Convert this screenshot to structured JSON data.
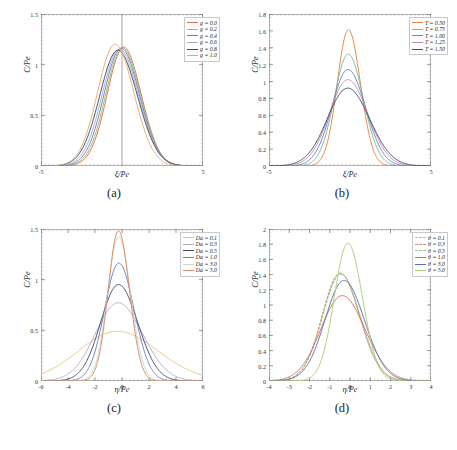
{
  "figure": {
    "panels": [
      {
        "id": "a",
        "caption": "(a)",
        "xlabel": "ξ/Pe",
        "ylabel": "C/Pe",
        "xlim": [
          -5,
          5
        ],
        "ylim": [
          0,
          1.5
        ],
        "xticks": [
          "-5",
          "5"
        ],
        "yticks": [
          "0",
          "0.5",
          "1",
          "1.5"
        ],
        "ytickvals": [
          0,
          0.5,
          1,
          1.5
        ],
        "xtickvals": [
          -5,
          5
        ],
        "vline": 0,
        "legend_pos": "top-right",
        "chart_data": {
          "type": "line",
          "title": "",
          "xlabel": "ξ/Pe",
          "ylabel": "C/Pe",
          "xlim": [
            -5,
            5
          ],
          "ylim": [
            0,
            1.5
          ],
          "grid": false,
          "legend": "top-right",
          "series": [
            {
              "name": "g = 0.0",
              "color": "#e06a4e",
              "dash": false,
              "peak": 1.17,
              "center": 0.18,
              "width": 1.05
            },
            {
              "name": "g = 0.2",
              "color": "#8fbf6a",
              "dash": false,
              "peak": 1.165,
              "center": 0.11,
              "width": 1.07
            },
            {
              "name": "g = 0.4",
              "color": "#6b7fc0",
              "dash": false,
              "peak": 1.16,
              "center": 0.03,
              "width": 1.1
            },
            {
              "name": "g = 0.6",
              "color": "#a9a9c4",
              "dash": false,
              "peak": 1.15,
              "center": -0.06,
              "width": 1.13
            },
            {
              "name": "g = 0.8",
              "color": "#3d4a6b",
              "dash": false,
              "peak": 1.14,
              "center": -0.16,
              "width": 1.17
            },
            {
              "name": "g = 1.0",
              "color": "#e8a86a",
              "dash": false,
              "peak": 1.2,
              "center": -0.34,
              "width": 1.12
            }
          ]
        }
      },
      {
        "id": "b",
        "caption": "(b)",
        "xlabel": "ξ/Pe",
        "ylabel": "C/Pe",
        "xlim": [
          -5,
          5
        ],
        "ylim": [
          0,
          1.8
        ],
        "xticks": [
          "-5",
          "5"
        ],
        "yticks": [
          "0",
          "0.2",
          "0.4",
          "0.6",
          "0.8",
          "1",
          "1.2",
          "1.4",
          "1.6",
          "1.8"
        ],
        "ytickvals": [
          0,
          0.2,
          0.4,
          0.6,
          0.8,
          1.0,
          1.2,
          1.4,
          1.6,
          1.8
        ],
        "xtickvals": [
          -5,
          5
        ],
        "vline": null,
        "legend_pos": "top-right",
        "chart_data": {
          "type": "line",
          "title": "",
          "xlabel": "ξ/Pe",
          "ylabel": "C/Pe",
          "xlim": [
            -5,
            5
          ],
          "ylim": [
            0,
            1.8
          ],
          "grid": false,
          "legend": "top-right",
          "series": [
            {
              "name": "T = 0.50",
              "color": "#e8833f",
              "dash": false,
              "peak": 1.61,
              "center": -0.04,
              "width": 0.72
            },
            {
              "name": "T = 0.75",
              "color": "#7ab8a0",
              "dash": false,
              "peak": 1.32,
              "center": -0.04,
              "width": 0.9
            },
            {
              "name": "T = 1.00",
              "color": "#6b82c4",
              "dash": false,
              "peak": 1.14,
              "center": -0.04,
              "width": 1.05
            },
            {
              "name": "T = 1.25",
              "color": "#c58aa8",
              "dash": false,
              "peak": 1.02,
              "center": -0.04,
              "width": 1.19
            },
            {
              "name": "T = 1.50",
              "color": "#3d4a6b",
              "dash": false,
              "peak": 0.92,
              "center": -0.04,
              "width": 1.31
            }
          ]
        }
      },
      {
        "id": "c",
        "caption": "(c)",
        "xlabel": "η/Pe",
        "ylabel": "C/Pe",
        "xlim": [
          -6,
          6
        ],
        "ylim": [
          0,
          1.5
        ],
        "xticks": [
          "-6",
          "-4",
          "-2",
          "0",
          "2",
          "4",
          "6"
        ],
        "yticks": [
          "0",
          "0.5",
          "1",
          "1.5"
        ],
        "ytickvals": [
          0,
          0.5,
          1,
          1.5
        ],
        "xtickvals": [
          -6,
          -4,
          -2,
          0,
          2,
          4,
          6
        ],
        "vline": null,
        "legend_pos": "top-right",
        "chart_data": {
          "type": "line",
          "title": "",
          "xlabel": "η/Pe",
          "ylabel": "C/Pe",
          "xlim": [
            -6,
            6
          ],
          "ylim": [
            0,
            1.5
          ],
          "grid": false,
          "legend": "top-right",
          "series": [
            {
              "name": "Da = 0.1",
              "color": "#e8c07a",
              "dash": false,
              "peak": 0.49,
              "center": -0.15,
              "width": 2.95
            },
            {
              "name": "Da = 0.3",
              "color": "#b8a8c8",
              "dash": false,
              "peak": 0.77,
              "center": -0.15,
              "width": 1.75
            },
            {
              "name": "Da = 0.5",
              "color": "#3d4a6b",
              "dash": false,
              "peak": 0.95,
              "center": -0.15,
              "width": 1.38
            },
            {
              "name": "Da = 1.0",
              "color": "#6b82c4",
              "dash": false,
              "peak": 1.16,
              "center": -0.15,
              "width": 1.1
            },
            {
              "name": "Da = 3.0",
              "color": "#cfd9c0",
              "dash": false,
              "peak": 1.42,
              "center": -0.18,
              "width": 0.86
            },
            {
              "name": "Da = 5.0",
              "color": "#d98a6a",
              "dash": false,
              "peak": 1.48,
              "center": -0.2,
              "width": 0.79
            }
          ]
        }
      },
      {
        "id": "d",
        "caption": "(d)",
        "xlabel": "η/Pe",
        "ylabel": "C/Pe",
        "xlim": [
          -4,
          4
        ],
        "ylim": [
          0,
          2
        ],
        "xticks": [
          "-4",
          "-3",
          "-2",
          "-1",
          "0",
          "1",
          "2",
          "3",
          "4"
        ],
        "yticks": [
          "0",
          "0.2",
          "0.4",
          "0.6",
          "0.8",
          "1",
          "1.2",
          "1.4",
          "1.6",
          "1.8",
          "2"
        ],
        "ytickvals": [
          0,
          0.2,
          0.4,
          0.6,
          0.8,
          1.0,
          1.2,
          1.4,
          1.6,
          1.8,
          2.0
        ],
        "xtickvals": [
          -4,
          -3,
          -2,
          -1,
          0,
          1,
          2,
          3,
          4
        ],
        "vline": null,
        "legend_pos": "top-right",
        "chart_data": {
          "type": "line",
          "title": "",
          "xlabel": "η/Pe",
          "ylabel": "C/Pe",
          "xlim": [
            -4,
            4
          ],
          "ylim": [
            0,
            2
          ],
          "grid": false,
          "legend": "top-right",
          "series": [
            {
              "name": "θ = 0.1",
              "color": "#b8b8b8",
              "dash": true,
              "peak": 1.42,
              "center": -0.42,
              "width": 0.92
            },
            {
              "name": "θ = 0.3",
              "color": "#d98a6a",
              "dash": true,
              "peak": 1.41,
              "center": -0.4,
              "width": 0.93
            },
            {
              "name": "θ = 0.5",
              "color": "#9cc47a",
              "dash": true,
              "peak": 1.4,
              "center": -0.38,
              "width": 0.94
            },
            {
              "name": "θ = 1.0",
              "color": "#d96a5a",
              "dash": false,
              "peak": 1.12,
              "center": -0.3,
              "width": 1.1
            },
            {
              "name": "θ = 3.0",
              "color": "#5a6fb8",
              "dash": false,
              "peak": 1.32,
              "center": -0.22,
              "width": 0.98
            },
            {
              "name": "θ = 5.0",
              "color": "#a8d07a",
              "dash": false,
              "peak": 1.81,
              "center": -0.05,
              "width": 0.7
            }
          ]
        }
      }
    ]
  }
}
